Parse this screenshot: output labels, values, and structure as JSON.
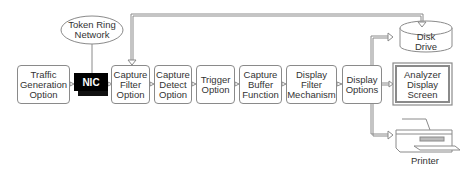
{
  "diagram": {
    "network": {
      "label_line1": "Token Ring",
      "label_line2": "Network"
    },
    "nic": {
      "label": "NIC"
    },
    "pipeline": [
      {
        "id": "traffic-generation",
        "lines": [
          "Traffic",
          "Generation",
          "Option"
        ]
      },
      {
        "id": "capture-filter",
        "lines": [
          "Capture",
          "Filter",
          "Option"
        ]
      },
      {
        "id": "capture-detect",
        "lines": [
          "Capture",
          "Detect",
          "Option"
        ]
      },
      {
        "id": "trigger",
        "lines": [
          "Trigger",
          "Option"
        ]
      },
      {
        "id": "capture-buffer",
        "lines": [
          "Capture",
          "Buffer",
          "Function"
        ]
      },
      {
        "id": "display-filter",
        "lines": [
          "Display",
          "Filter",
          "Mechanism"
        ]
      },
      {
        "id": "display-options",
        "lines": [
          "Display",
          "Options"
        ]
      }
    ],
    "outputs": {
      "disk": {
        "line1": "Disk",
        "line2": "Drive"
      },
      "screen": {
        "line1": "Analyzer",
        "line2": "Display",
        "line3": "Screen"
      },
      "printer": {
        "label": "Printer"
      }
    },
    "colors": {
      "line": "#8a8a8a",
      "nic_bg": "#000000",
      "text": "#333333"
    }
  }
}
